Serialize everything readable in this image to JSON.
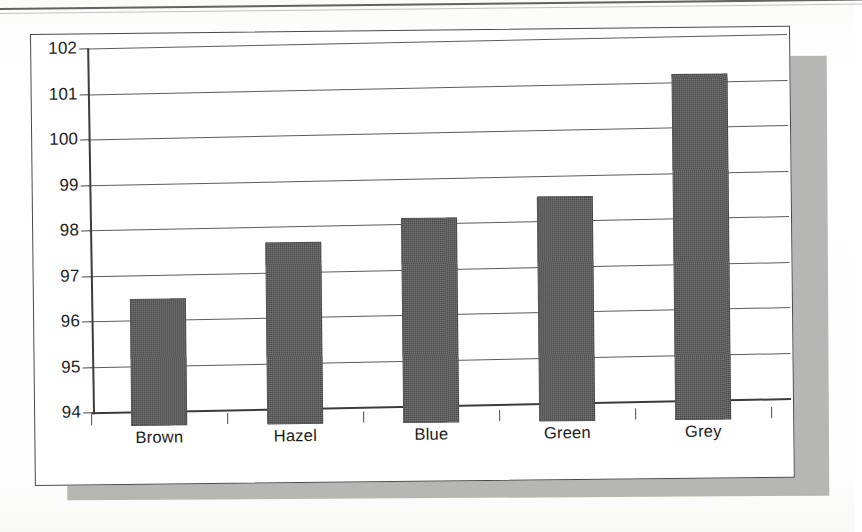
{
  "chart_data": {
    "type": "bar",
    "title": "",
    "subtitle": "",
    "xlabel": "",
    "ylabel": "",
    "categories": [
      "Brown",
      "Hazel",
      "Blue",
      "Green",
      "Grey"
    ],
    "values": [
      96.8,
      98.0,
      98.5,
      98.95,
      101.6
    ],
    "series": [
      {
        "name": "",
        "values": [
          96.8,
          98.0,
          98.5,
          98.95,
          101.6
        ]
      }
    ],
    "ylim": [
      94,
      102
    ],
    "y_ticks": [
      94,
      95,
      96,
      97,
      98,
      99,
      100,
      101,
      102
    ],
    "y_tick_labels": [
      "94",
      "95",
      "96",
      "97",
      "98",
      "99",
      "100",
      "101",
      "102"
    ],
    "x_tick_labels": [
      "Brown",
      "Hazel",
      "Blue",
      "Green",
      "Grey"
    ],
    "grid": true,
    "grid_axis": "y",
    "legend": false,
    "legend_position": "none",
    "bar_color": "#4b4b4b",
    "axis_color": "#3c3c3c",
    "gridline_color": "#5d5d5d",
    "plot_background": "#ffffff",
    "annotations": []
  },
  "figure": {
    "card_background": "#ffffff",
    "card_border_color": "#4a4a4a",
    "shadow_color": "#b6b6b4",
    "page_background": "#fdfdfc",
    "page_rule_color": "#4c4c4c"
  }
}
